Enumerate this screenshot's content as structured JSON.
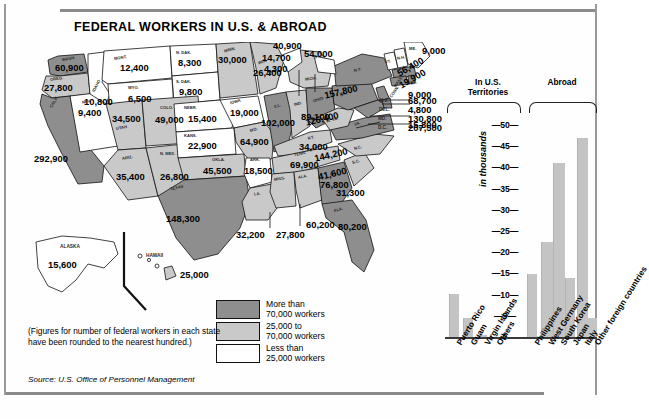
{
  "title": "FEDERAL WORKERS IN U.S. & ABROAD",
  "note": "(Figures for number of federal workers in each state have been rounded to the nearest hundred.)",
  "source": "Source: U.S. Office of Personnel Management",
  "legend": {
    "items": [
      {
        "swatch": "dark",
        "line1": "More than",
        "line2": "70,000 workers"
      },
      {
        "swatch": "mid",
        "line1": "25,000 to",
        "line2": "70,000 workers"
      },
      {
        "swatch": "light",
        "line1": "Less than",
        "line2": "25,000 workers"
      }
    ]
  },
  "map": {
    "states": [
      {
        "abbr": "WASH.",
        "value": "60,900"
      },
      {
        "abbr": "OREG.",
        "value": "27,800"
      },
      {
        "abbr": "IDAHO",
        "value": "10,800"
      },
      {
        "abbr": "MONT.",
        "value": "12,400"
      },
      {
        "abbr": "N. DAK.",
        "value": "8,300"
      },
      {
        "abbr": "MINN.",
        "value": "30,000"
      },
      {
        "abbr": "WIS.",
        "value": "26,400"
      },
      {
        "abbr": "S. DAK.",
        "value": "9,800"
      },
      {
        "abbr": "WYO.",
        "value": "6,500"
      },
      {
        "abbr": "NEV.",
        "value": "9,400"
      },
      {
        "abbr": "CALIF.",
        "value": "292,900"
      },
      {
        "abbr": "UTAH",
        "value": "34,500"
      },
      {
        "abbr": "COLO.",
        "value": "49,000"
      },
      {
        "abbr": "NEBR.",
        "value": "15,400"
      },
      {
        "abbr": "IOWA",
        "value": "19,000"
      },
      {
        "abbr": "KANS.",
        "value": "22,900"
      },
      {
        "abbr": "MO.",
        "value": "64,900"
      },
      {
        "abbr": "ILL.",
        "value": "102,000"
      },
      {
        "abbr": "IND.",
        "value": "40,900"
      },
      {
        "abbr": "MICH.",
        "value": "54,000"
      },
      {
        "abbr": "OHIO",
        "value": "89,100"
      },
      {
        "abbr": "ARIZ.",
        "value": "35,400"
      },
      {
        "abbr": "N. MEX.",
        "value": "26,800"
      },
      {
        "abbr": "OKLA.",
        "value": "45,500"
      },
      {
        "abbr": "ARK.",
        "value": "18,500"
      },
      {
        "abbr": "TEXAS",
        "value": "148,300"
      },
      {
        "abbr": "LA.",
        "value": "32,200"
      },
      {
        "abbr": "MISS.",
        "value": "27,800"
      },
      {
        "abbr": "ALA.",
        "value": "60,200"
      },
      {
        "abbr": "TENN.",
        "value": "69,900"
      },
      {
        "abbr": "KY.",
        "value": "34,000"
      },
      {
        "abbr": "GA.",
        "value": "76,800"
      },
      {
        "abbr": "FLA.",
        "value": "80,200"
      },
      {
        "abbr": "S.C.",
        "value": "31,300"
      },
      {
        "abbr": "N.C.",
        "value": "41,600"
      },
      {
        "abbr": "VA.",
        "value": "144,200"
      },
      {
        "abbr": "W. VA.",
        "value": "15,800"
      },
      {
        "abbr": "PA.",
        "value": "126,400"
      },
      {
        "abbr": "N.Y.",
        "value": "157,800"
      },
      {
        "abbr": "VT.",
        "value": "4,300"
      },
      {
        "abbr": "N.H.",
        "value": "14,700"
      },
      {
        "abbr": "ME.",
        "value": "9,000"
      },
      {
        "abbr": "MASS.",
        "value": "56,400"
      },
      {
        "abbr": "CONN.",
        "value": "19,900"
      },
      {
        "abbr": "R.I.",
        "value": "9,000"
      },
      {
        "abbr": "N.J.",
        "value": "68,700"
      },
      {
        "abbr": "DEL.",
        "value": "4,800"
      },
      {
        "abbr": "MD.",
        "value": "130,800"
      },
      {
        "abbr": "D.C.",
        "value": "207,500"
      },
      {
        "abbr": "ALASKA",
        "value": "15,600"
      },
      {
        "abbr": "HAWAII",
        "value": "25,000"
      }
    ],
    "callouts": [
      {
        "abbr": "N.J.",
        "value": "68,700"
      },
      {
        "abbr": "DEL.",
        "value": "4,800"
      },
      {
        "abbr": "MD.",
        "value": "130,800"
      },
      {
        "abbr": "D.C.",
        "value": "207,500"
      }
    ]
  },
  "chart_data": {
    "type": "bar",
    "title": "",
    "xlabel": "",
    "ylabel": "in thousands",
    "ylim": [
      0,
      50
    ],
    "yticks": [
      0,
      5,
      10,
      15,
      20,
      25,
      30,
      35,
      40,
      45,
      50
    ],
    "grid": false,
    "legend": "none",
    "groups": [
      {
        "name": "In U.S. Territories",
        "categories": [
          "Puerto Rico",
          "Guam",
          "Virgin Islands",
          "Others"
        ]
      },
      {
        "name": "Abroad",
        "categories": [
          "Philippines",
          "West Germany",
          "South Korea",
          "Japan",
          "Italy",
          "Other foreign countries"
        ]
      }
    ],
    "categories": [
      "Puerto Rico",
      "Guam",
      "Virgin Islands",
      "Others",
      "Philippines",
      "West Germany",
      "South Korea",
      "Japan",
      "Italy",
      "Other foreign countries"
    ],
    "values": [
      10.2,
      4.4,
      0.4,
      0.0,
      14.8,
      22.4,
      41.0,
      14.0,
      4.0,
      4.4
    ],
    "extra_bar": {
      "category": "Other foreign countries",
      "value": 47.0
    },
    "bar_color": "#c4c4c4"
  },
  "chart_labels": {
    "group_territories_line1": "In U.S.",
    "group_territories_line2": "Territories",
    "group_abroad": "Abroad",
    "axis_title": "in thousands"
  }
}
